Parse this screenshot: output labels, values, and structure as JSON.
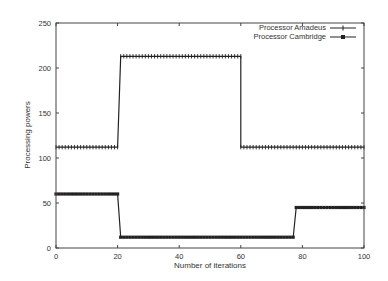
{
  "chart_data": {
    "type": "line",
    "title": "",
    "xlabel": "Number of iterations",
    "ylabel": "Processing powers",
    "xlim": [
      0,
      100
    ],
    "ylim": [
      0,
      250
    ],
    "xticks": [
      0,
      20,
      40,
      60,
      80,
      100
    ],
    "yticks": [
      0,
      50,
      100,
      150,
      200,
      250
    ],
    "grid": false,
    "legend_position": "top-right",
    "series": [
      {
        "name": "Processor Amadeus",
        "marker": "plus",
        "color": "#222222",
        "segments": [
          {
            "x_start": 0,
            "x_end": 20,
            "value": 112
          },
          {
            "x_start": 21,
            "x_end": 60,
            "value": 213
          },
          {
            "x_start": 60,
            "x_end": 100,
            "value": 112
          }
        ]
      },
      {
        "name": "Processor Cambridge",
        "marker": "filled-square",
        "color": "#222222",
        "segments": [
          {
            "x_start": 0,
            "x_end": 20,
            "value": 60
          },
          {
            "x_start": 21,
            "x_end": 77,
            "value": 12
          },
          {
            "x_start": 78,
            "x_end": 100,
            "value": 45
          }
        ]
      }
    ]
  },
  "axes": {
    "xlabel": "Number of iterations",
    "ylabel": "Processing powers"
  },
  "legend": {
    "items": [
      "Processor Amadeus",
      "Processor Cambridge"
    ]
  }
}
